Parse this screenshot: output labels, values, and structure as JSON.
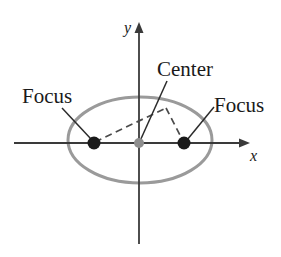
{
  "figure": {
    "type": "geometry-diagram",
    "width": 281,
    "height": 257,
    "background_color": "#ffffff"
  },
  "colors": {
    "ellipse_stroke": "#9a9a9a",
    "axis_stroke": "#3a3a3a",
    "focus_fill": "#1a1a1a",
    "center_fill": "#8e8e8e",
    "leader_stroke": "#2b2b2b",
    "dashed_stroke": "#4a4a4a",
    "text": "#1a1a1a"
  },
  "axes": {
    "x_label": "x",
    "y_label": "y",
    "origin": {
      "x": 139,
      "y": 143
    },
    "x_axis": {
      "x1": 14,
      "y1": 143,
      "x2": 249,
      "y2": 143,
      "arrow": "right"
    },
    "y_axis": {
      "x1": 139,
      "y1": 244,
      "x2": 139,
      "y2": 22,
      "arrow": "up"
    },
    "x_label_pos": {
      "x": 252,
      "y": 160
    },
    "y_label_pos": {
      "x": 126,
      "y": 32
    }
  },
  "ellipse": {
    "center": {
      "x": 140,
      "y": 140
    },
    "semi_major_x": 72,
    "semi_minor_y": 43,
    "stroke_width": 3
  },
  "points": [
    {
      "name": "left-focus",
      "label": "Focus",
      "x": 94,
      "y": 143,
      "radius": 6.5,
      "kind": "focus"
    },
    {
      "name": "center-point",
      "label": "Center",
      "x": 139,
      "y": 143,
      "radius": 5,
      "kind": "center"
    },
    {
      "name": "right-focus",
      "label": "Focus",
      "x": 184,
      "y": 143,
      "radius": 6.5,
      "kind": "focus"
    }
  ],
  "labels": {
    "focus_left": {
      "text": "Focus",
      "x": 22,
      "y": 103
    },
    "center": {
      "text": "Center",
      "x": 157,
      "y": 76
    },
    "focus_right": {
      "text": "Focus",
      "x": 214,
      "y": 112
    }
  },
  "leader_lines": [
    {
      "name": "leader-focus-left",
      "x1": 62,
      "y1": 108,
      "x2": 91,
      "y2": 139
    },
    {
      "name": "leader-center",
      "x1": 167,
      "y1": 81,
      "x2": 140,
      "y2": 141
    },
    {
      "name": "leader-focus-right",
      "x1": 214,
      "y1": 107,
      "x2": 187,
      "y2": 140
    }
  ],
  "dashed_segments": [
    {
      "name": "dashed-left-focus-to-point",
      "x1": 95,
      "y1": 142,
      "x2": 166,
      "y2": 108
    },
    {
      "name": "dashed-point-to-right-focus",
      "x1": 166,
      "y1": 108,
      "x2": 183,
      "y2": 141
    }
  ],
  "ellipse_point": {
    "x": 166,
    "y": 108
  }
}
